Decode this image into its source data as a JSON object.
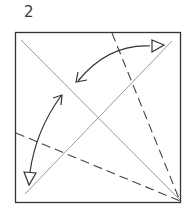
{
  "diagram": {
    "step_number": "2",
    "type": "origami-fold-step",
    "elements": {
      "paper": "square sheet outline",
      "creases": [
        "diagonal top-left to bottom-right (existing crease)",
        "diagonal bottom-left to top-right (existing crease)"
      ],
      "valley_folds": [
        "dashed line from top edge to bottom-right corner",
        "dashed line from left edge to bottom-right corner"
      ],
      "arrows": [
        "fold top-right edge to center diagonal (double-headed curved arrow)",
        "fold bottom-left edge to center diagonal (double-headed curved arrow)"
      ]
    },
    "colors": {
      "outline": "#333333",
      "crease": "#9a9a9a",
      "fold_line": "#444444",
      "arrow": "#333333"
    }
  }
}
